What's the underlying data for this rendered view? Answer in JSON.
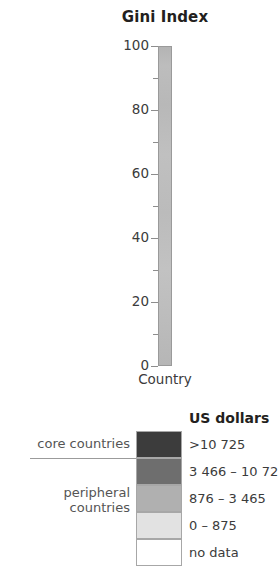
{
  "chart_data": {
    "type": "colorbar-legend",
    "title": "Gini Index",
    "xlabel": "Country",
    "ylabel": "",
    "axis": {
      "ylim": [
        0,
        100
      ],
      "major_ticks": [
        0,
        20,
        40,
        60,
        80,
        100
      ],
      "major_tick_labels": [
        "0",
        "20",
        "40",
        "60",
        "80",
        "100"
      ],
      "minor_ticks": [
        10,
        30,
        50,
        70,
        90
      ],
      "grid": false,
      "orientation": "vertical",
      "bar_fill": "#bbbbbb"
    },
    "legend": {
      "heading": "US dollars",
      "position": "right",
      "entries": [
        {
          "label": ">10 725",
          "color": "#3c3c3c",
          "group": "core countries"
        },
        {
          "label": "3 466 – 10 725",
          "color": "#6e6e6e",
          "group": "core countries"
        },
        {
          "label": "876 – 3 465",
          "color": "#b0b0b0",
          "group": "peripheral countries"
        },
        {
          "label": "0 – 875",
          "color": "#e2e2e2",
          "group": "peripheral countries"
        },
        {
          "label": "no data",
          "color": "#ffffff",
          "group": ""
        }
      ],
      "groups": [
        {
          "name": "core countries",
          "text": "core countries"
        },
        {
          "name": "peripheral countries",
          "text": "peripheral\ncountries"
        }
      ]
    }
  },
  "gini": {
    "title": "Gini Index",
    "x_axis_label": "Country",
    "ticks": [
      {
        "value": 100,
        "label": "100",
        "type": "major"
      },
      {
        "value": 90,
        "label": "",
        "type": "minor"
      },
      {
        "value": 80,
        "label": "80",
        "type": "major"
      },
      {
        "value": 70,
        "label": "",
        "type": "minor"
      },
      {
        "value": 60,
        "label": "60",
        "type": "major"
      },
      {
        "value": 50,
        "label": "",
        "type": "minor"
      },
      {
        "value": 40,
        "label": "40",
        "type": "major"
      },
      {
        "value": 30,
        "label": "",
        "type": "minor"
      },
      {
        "value": 20,
        "label": "20",
        "type": "major"
      },
      {
        "value": 10,
        "label": "",
        "type": "minor"
      },
      {
        "value": 0,
        "label": "0",
        "type": "major"
      }
    ]
  },
  "legend": {
    "heading": "US dollars",
    "rows": [
      {
        "swatch_color": "#3c3c3c",
        "value": ">10 725"
      },
      {
        "swatch_color": "#6e6e6e",
        "value": "3 466 – 10 725"
      },
      {
        "swatch_color": "#b0b0b0",
        "value": "876 – 3 465"
      },
      {
        "swatch_color": "#e2e2e2",
        "value": "0 – 875"
      },
      {
        "swatch_color": "#ffffff",
        "value": "no data"
      }
    ],
    "group_core": "core countries",
    "group_peripheral": "peripheral\ncountries"
  }
}
